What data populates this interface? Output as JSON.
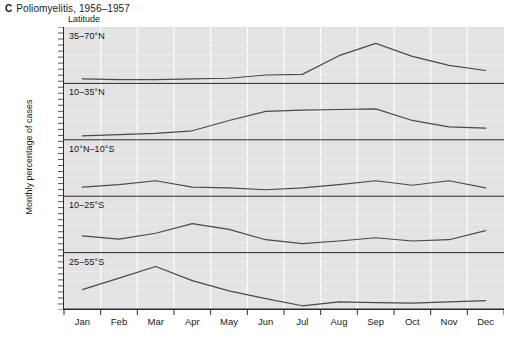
{
  "figure": {
    "panel_letter": "C",
    "title": "Poliomyelitis, 1956–1957",
    "ylabel": "Monthly percentage of cases",
    "latitude_caption": "Latitude"
  },
  "colors": {
    "plot_background": "#e3e3e3",
    "gridline": "#ffffff",
    "curve": "#4a4a4a",
    "axis": "#2b2b2b",
    "text": "#1a1a1a"
  },
  "chart_data": {
    "type": "line",
    "title": "Poliomyelitis, 1956–1957",
    "subtitle": "",
    "xlabel": "",
    "ylabel": "Monthly percentage of cases",
    "grid": true,
    "legend_position": "none",
    "layout": "small-multiples-stacked",
    "panel_count": 5,
    "x": [
      "Jan",
      "Feb",
      "Mar",
      "Apr",
      "May",
      "Jun",
      "Jul",
      "Aug",
      "Sep",
      "Oct",
      "Nov",
      "Dec"
    ],
    "categories": [
      "Jan",
      "Feb",
      "Mar",
      "Apr",
      "May",
      "Jun",
      "Jul",
      "Aug",
      "Sep",
      "Oct",
      "Nov",
      "Dec"
    ],
    "ylim": [
      0,
      100
    ],
    "yticks_labeled": false,
    "series": [
      {
        "name": "35–70°N",
        "panel": 1,
        "values": [
          7,
          6,
          6,
          7,
          8,
          13,
          14,
          43,
          62,
          42,
          28,
          20
        ]
      },
      {
        "name": "10–35°N",
        "panel": 2,
        "values": [
          6,
          8,
          10,
          14,
          30,
          44,
          46,
          47,
          48,
          30,
          20,
          18
        ]
      },
      {
        "name": "10°N–10°S",
        "panel": 3,
        "values": [
          14,
          18,
          24,
          14,
          13,
          10,
          13,
          18,
          24,
          17,
          24,
          13
        ]
      },
      {
        "name": "10–25°S",
        "panel": 4,
        "values": [
          26,
          21,
          30,
          45,
          36,
          20,
          14,
          18,
          23,
          18,
          20,
          34
        ]
      },
      {
        "name": "25–55°S",
        "panel": 5,
        "values": [
          30,
          48,
          66,
          44,
          28,
          16,
          5,
          11,
          10,
          9,
          11,
          13
        ]
      }
    ]
  }
}
